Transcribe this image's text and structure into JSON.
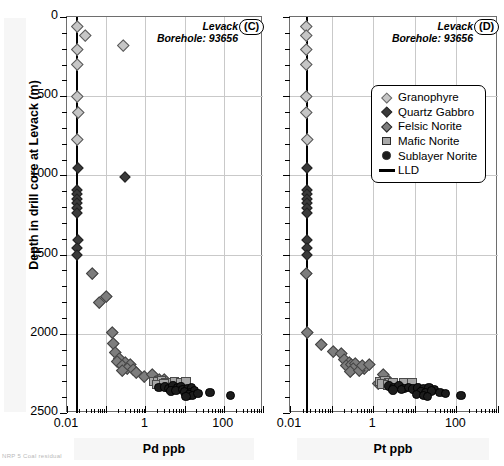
{
  "figure": {
    "y_axis_label": "Depth in drill core at Levack (m)",
    "caption": "NRP 5 Coal residual"
  },
  "legend": {
    "items": [
      {
        "label": "Granophyre",
        "symbol": "diamond",
        "color": "#c6c6c6"
      },
      {
        "label": "Quartz Gabbro",
        "symbol": "diamond",
        "color": "#3a3a3a"
      },
      {
        "label": "Felsic Norite",
        "symbol": "diamond",
        "color": "#7d7d7d"
      },
      {
        "label": "Mafic Norite",
        "symbol": "square",
        "color": "#a8a8a8"
      },
      {
        "label": "Sublayer Norite",
        "symbol": "circle",
        "color": "#1c1c1c"
      },
      {
        "label": "LLD",
        "symbol": "line",
        "color": "#000000"
      }
    ]
  },
  "chart_data": [
    {
      "type": "scatter",
      "panel": "C",
      "title": "Levack",
      "subtitle": "Borehole: 93656",
      "xlabel": "Pd ppb",
      "ylabel": "Depth in drill core at Levack (m)",
      "xscale": "log",
      "xlim": [
        0.01,
        1000
      ],
      "ylim": [
        0,
        2500
      ],
      "y_inverted": true,
      "xticks": [
        0.01,
        1,
        100
      ],
      "xtick_labels": [
        "0.01",
        "1",
        "100"
      ],
      "yticks": [
        0,
        500,
        1000,
        1500,
        2000,
        2500
      ],
      "ytick_labels": [
        "0",
        "500",
        "1000",
        "1500",
        "2000",
        "2500"
      ],
      "grid": true,
      "lld_value": 0.018,
      "series": [
        {
          "name": "Granophyre",
          "points": [
            [
              0.018,
              60
            ],
            [
              0.03,
              118
            ],
            [
              0.018,
              205
            ],
            [
              0.28,
              180
            ],
            [
              0.018,
              300
            ],
            [
              0.018,
              500
            ],
            [
              0.019,
              600
            ],
            [
              0.018,
              770
            ]
          ]
        },
        {
          "name": "Quartz Gabbro",
          "points": [
            [
              0.019,
              955
            ],
            [
              0.3,
              1010
            ],
            [
              0.018,
              1090
            ],
            [
              0.018,
              1120
            ],
            [
              0.018,
              1150
            ],
            [
              0.018,
              1175
            ],
            [
              0.018,
              1205
            ],
            [
              0.018,
              1240
            ],
            [
              0.019,
              1405
            ],
            [
              0.018,
              1460
            ],
            [
              0.018,
              1500
            ]
          ]
        },
        {
          "name": "Felsic Norite",
          "points": [
            [
              0.045,
              1620
            ],
            [
              0.1,
              1760
            ],
            [
              0.065,
              1800
            ],
            [
              0.14,
              1990
            ],
            [
              0.155,
              2060
            ],
            [
              0.175,
              2115
            ],
            [
              0.22,
              2155
            ],
            [
              0.19,
              2175
            ],
            [
              0.3,
              2180
            ],
            [
              0.25,
              2200
            ],
            [
              0.42,
              2195
            ],
            [
              0.34,
              2215
            ],
            [
              0.26,
              2230
            ],
            [
              0.48,
              2225
            ],
            [
              0.6,
              2240
            ],
            [
              0.95,
              2265
            ],
            [
              1.5,
              2255
            ],
            [
              2.2,
              2285
            ],
            [
              1.8,
              2300
            ],
            [
              3.0,
              2290
            ]
          ]
        },
        {
          "name": "Mafic Norite",
          "points": [
            [
              1.6,
              2300
            ],
            [
              2.1,
              2305
            ],
            [
              2.6,
              2298
            ],
            [
              3.4,
              2308
            ],
            [
              2.0,
              2320
            ],
            [
              3.0,
              2316
            ],
            [
              5.5,
              2305
            ],
            [
              8.0,
              2312
            ],
            [
              11,
              2305
            ]
          ]
        },
        {
          "name": "Sublayer Norite",
          "points": [
            [
              2.2,
              2340
            ],
            [
              3.2,
              2335
            ],
            [
              4.0,
              2345
            ],
            [
              5.0,
              2330
            ],
            [
              6.5,
              2342
            ],
            [
              8.0,
              2336
            ],
            [
              4.5,
              2360
            ],
            [
              6.0,
              2358
            ],
            [
              9.0,
              2352
            ],
            [
              12,
              2345
            ],
            [
              15,
              2340
            ],
            [
              10,
              2368
            ],
            [
              14,
              2372
            ],
            [
              18,
              2360
            ],
            [
              13,
              2385
            ],
            [
              16,
              2390
            ],
            [
              11,
              2395
            ],
            [
              22,
              2378
            ],
            [
              45,
              2372
            ],
            [
              150,
              2390
            ]
          ]
        }
      ]
    },
    {
      "type": "scatter",
      "panel": "D",
      "title": "Levack",
      "subtitle": "Borehole: 93656",
      "xlabel": "Pt ppb",
      "ylabel": "Depth in drill core at Levack (m)",
      "xscale": "log",
      "xlim": [
        0.01,
        1000
      ],
      "ylim": [
        0,
        2500
      ],
      "y_inverted": true,
      "xticks": [
        0.01,
        1,
        100
      ],
      "xtick_labels": [
        "0.01",
        "1",
        "100"
      ],
      "yticks": [
        0,
        500,
        1000,
        1500,
        2000,
        2500
      ],
      "ytick_labels": [
        "0",
        "500",
        "1000",
        "1500",
        "2000",
        "2500"
      ],
      "grid": true,
      "lld_value": 0.025,
      "series": [
        {
          "name": "Granophyre",
          "points": [
            [
              0.025,
              60
            ],
            [
              0.025,
              118
            ],
            [
              0.025,
              205
            ],
            [
              0.025,
              300
            ],
            [
              0.025,
              500
            ],
            [
              0.025,
              600
            ],
            [
              0.026,
              770
            ]
          ]
        },
        {
          "name": "Quartz Gabbro",
          "points": [
            [
              0.025,
              955
            ],
            [
              0.025,
              1090
            ],
            [
              0.025,
              1120
            ],
            [
              0.025,
              1150
            ],
            [
              0.025,
              1175
            ],
            [
              0.025,
              1205
            ],
            [
              0.025,
              1240
            ],
            [
              0.025,
              1405
            ],
            [
              0.025,
              1460
            ],
            [
              0.025,
              1500
            ]
          ]
        },
        {
          "name": "Felsic Norite",
          "points": [
            [
              0.025,
              1620
            ],
            [
              0.6,
              2215
            ],
            [
              0.026,
              1990
            ],
            [
              0.055,
              2065
            ],
            [
              0.11,
              2110
            ],
            [
              0.17,
              2125
            ],
            [
              0.2,
              2160
            ],
            [
              0.26,
              2180
            ],
            [
              0.23,
              2200
            ],
            [
              0.3,
              2195
            ],
            [
              0.38,
              2185
            ],
            [
              0.34,
              2215
            ],
            [
              0.28,
              2235
            ],
            [
              0.45,
              2230
            ],
            [
              0.55,
              2200
            ],
            [
              0.8,
              2195
            ],
            [
              1.7,
              2255
            ],
            [
              2.4,
              2300
            ],
            [
              1.3,
              2310
            ]
          ]
        },
        {
          "name": "Mafic Norite",
          "points": [
            [
              1.4,
              2300
            ],
            [
              1.9,
              2296
            ],
            [
              2.4,
              2306
            ],
            [
              1.6,
              2318
            ],
            [
              2.2,
              2322
            ],
            [
              3.0,
              2312
            ],
            [
              5.5,
              2308
            ],
            [
              8.5,
              2312
            ]
          ]
        },
        {
          "name": "Sublayer Norite",
          "points": [
            [
              2.4,
              2330
            ],
            [
              3.2,
              2338
            ],
            [
              4.2,
              2330
            ],
            [
              5.5,
              2344
            ],
            [
              3.0,
              2356
            ],
            [
              4.8,
              2352
            ],
            [
              7.0,
              2340
            ],
            [
              9.0,
              2350
            ],
            [
              12,
              2342
            ],
            [
              16,
              2348
            ],
            [
              22,
              2340
            ],
            [
              30,
              2352
            ],
            [
              14,
              2368
            ],
            [
              18,
              2372
            ],
            [
              25,
              2362
            ],
            [
              11,
              2382
            ],
            [
              16,
              2388
            ],
            [
              20,
              2395
            ],
            [
              40,
              2370
            ],
            [
              55,
              2378
            ],
            [
              130,
              2390
            ]
          ]
        }
      ]
    }
  ]
}
